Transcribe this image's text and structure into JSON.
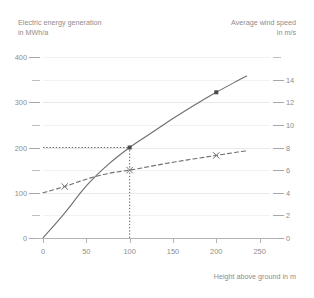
{
  "titles": {
    "left_axis": "Electric energy generation\nin MWh/a",
    "right_axis": "Average wind speed\nin m/s",
    "x_axis": "Height above ground in m"
  },
  "chart_data": {
    "type": "line",
    "title": "",
    "xlabel": "Height above ground in m",
    "ylabel": "Electric energy generation in MWh/a",
    "y2label": "Average wind speed in m/s",
    "xlim": [
      0,
      262
    ],
    "ylim": [
      0,
      400
    ],
    "y2lim": [
      0,
      16
    ],
    "grid": true,
    "legend": "none",
    "x_ticks": [
      0,
      50,
      100,
      150,
      200,
      250
    ],
    "y_ticks_left": [
      0,
      100,
      200,
      300,
      400
    ],
    "y_minor_left": [
      50,
      150,
      250,
      350
    ],
    "y_ticks_right": [
      0,
      2,
      4,
      6,
      8,
      10,
      12,
      14
    ],
    "y_minor_right": [
      16
    ],
    "series": [
      {
        "name": "Electric energy generation",
        "axis": "left",
        "style": "solid",
        "color": "#6e6e6e",
        "points": [
          {
            "x": 0,
            "y": 0
          },
          {
            "x": 25,
            "y": 55
          },
          {
            "x": 50,
            "y": 115
          },
          {
            "x": 75,
            "y": 162
          },
          {
            "x": 100,
            "y": 200
          },
          {
            "x": 125,
            "y": 232
          },
          {
            "x": 150,
            "y": 264
          },
          {
            "x": 175,
            "y": 294
          },
          {
            "x": 200,
            "y": 322
          },
          {
            "x": 225,
            "y": 348
          },
          {
            "x": 235,
            "y": 358
          }
        ],
        "markers": [
          {
            "x": 100,
            "y": 200,
            "shape": "square"
          },
          {
            "x": 200,
            "y": 322,
            "shape": "square"
          }
        ]
      },
      {
        "name": "Average wind speed",
        "axis": "right",
        "style": "dashed",
        "color": "#6e6e6e",
        "points": [
          {
            "x": 0,
            "y": 4.0
          },
          {
            "x": 25,
            "y": 4.55
          },
          {
            "x": 50,
            "y": 5.2
          },
          {
            "x": 75,
            "y": 5.7
          },
          {
            "x": 100,
            "y": 6.0
          },
          {
            "x": 125,
            "y": 6.35
          },
          {
            "x": 150,
            "y": 6.7
          },
          {
            "x": 175,
            "y": 7.0
          },
          {
            "x": 200,
            "y": 7.3
          },
          {
            "x": 225,
            "y": 7.6
          },
          {
            "x": 235,
            "y": 7.7
          }
        ],
        "markers": [
          {
            "x": 25,
            "y": 4.55,
            "shape": "x"
          },
          {
            "x": 100,
            "y": 6.0,
            "shape": "x"
          },
          {
            "x": 200,
            "y": 7.3,
            "shape": "x"
          }
        ]
      }
    ],
    "annotations": [
      {
        "type": "guideline",
        "style": "dotted",
        "from_x": 0,
        "to_x": 100,
        "y": 200,
        "axis": "left"
      },
      {
        "type": "guideline",
        "style": "dotted",
        "x": 100,
        "from_y": 0,
        "to_y": 200,
        "axis": "left"
      }
    ]
  }
}
